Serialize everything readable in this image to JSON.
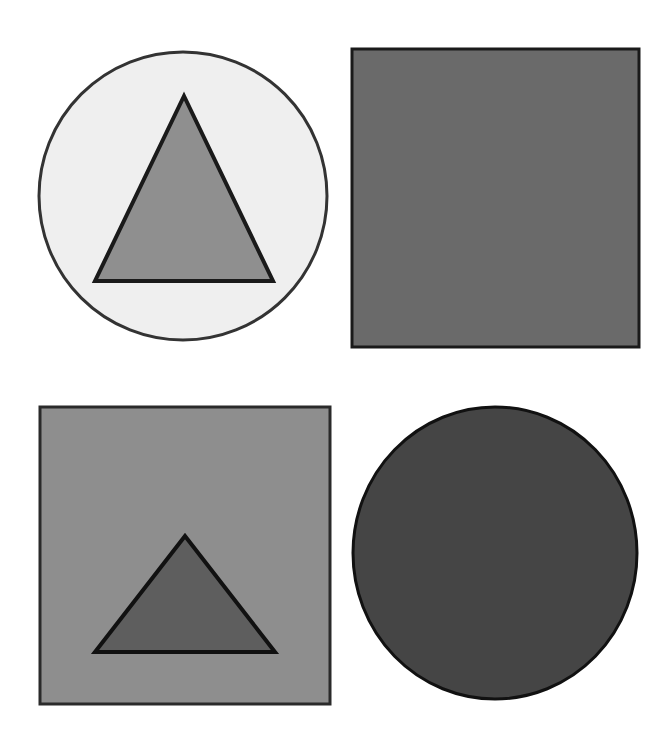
{
  "figure": {
    "background": "#ffffff",
    "panels": [
      {
        "id": "top-left",
        "outer": {
          "shape": "circle",
          "fill": "#efefef",
          "stroke": "#333333"
        },
        "inner": {
          "shape": "triangle",
          "fill": "#8f8f8f",
          "stroke": "#1a1a1a"
        }
      },
      {
        "id": "top-right",
        "outer": {
          "shape": "square",
          "fill": "#6a6a6a",
          "stroke": "#1a1a1a"
        },
        "inner": null
      },
      {
        "id": "bottom-left",
        "outer": {
          "shape": "square",
          "fill": "#8e8e8e",
          "stroke": "#2a2a2a"
        },
        "inner": {
          "shape": "triangle",
          "fill": "#5e5e5e",
          "stroke": "#111111"
        }
      },
      {
        "id": "bottom-right",
        "outer": {
          "shape": "circle",
          "fill": "#454545",
          "stroke": "#111111"
        },
        "inner": null
      }
    ]
  }
}
